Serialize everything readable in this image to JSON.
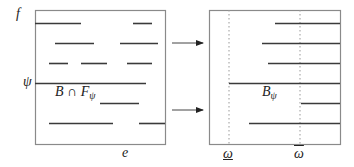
{
  "colors": {
    "line": "#3a3a3a",
    "frame": "#8a8a8a",
    "dotted": "#999999",
    "text": "#222222"
  },
  "labels": {
    "f": "f",
    "psi": "ψ",
    "intersection_main": "B ∩ F",
    "intersection_sub": "ψ",
    "b_psi_main": "B",
    "b_psi_sub": "ψ",
    "e": "e",
    "omega_lower": "ω",
    "omega_upper": "ω"
  },
  "left_box": {
    "x": 35,
    "y": 10,
    "w": 130,
    "h": 134,
    "segments": [
      {
        "y": 23,
        "x1": 35,
        "x2": 81
      },
      {
        "y": 23,
        "x1": 133,
        "x2": 152
      },
      {
        "y": 43,
        "x1": 55,
        "x2": 94
      },
      {
        "y": 43,
        "x1": 120,
        "x2": 158
      },
      {
        "y": 63,
        "x1": 49,
        "x2": 68
      },
      {
        "y": 63,
        "x1": 81,
        "x2": 107
      },
      {
        "y": 63,
        "x1": 127,
        "x2": 152
      },
      {
        "y": 83,
        "x1": 35,
        "x2": 146
      },
      {
        "y": 103,
        "x1": 100,
        "x2": 139
      },
      {
        "y": 123,
        "x1": 49,
        "x2": 113
      },
      {
        "y": 123,
        "x1": 139,
        "x2": 165
      }
    ]
  },
  "right_box": {
    "x": 209,
    "y": 10,
    "w": 131,
    "h": 134,
    "dotted_x": [
      229,
      300
    ],
    "segments": [
      {
        "y": 23,
        "x1": 275,
        "x2": 340
      },
      {
        "y": 43,
        "x1": 262,
        "x2": 340
      },
      {
        "y": 63,
        "x1": 268,
        "x2": 340
      },
      {
        "y": 83,
        "x1": 229,
        "x2": 340
      },
      {
        "y": 103,
        "x1": 301,
        "x2": 340
      },
      {
        "y": 123,
        "x1": 249,
        "x2": 340
      }
    ]
  },
  "arrows": [
    {
      "y": 43,
      "x1": 172,
      "x2": 203
    },
    {
      "y": 110,
      "x1": 172,
      "x2": 203
    }
  ]
}
